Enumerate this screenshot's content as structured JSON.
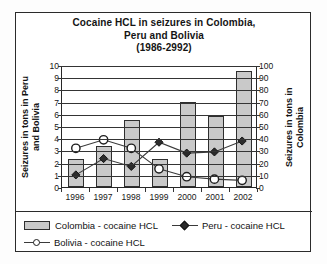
{
  "chart_data": {
    "type": "bar",
    "title": "Cocaine HCL in seizures in Colombia, Peru and Bolivia (1986-2992)",
    "title_lines": [
      "Cocaine HCL in seizures in Colombia,",
      "Peru and Bolivia",
      "(1986-2992)"
    ],
    "categories": [
      "1996",
      "1997",
      "1998",
      "1999",
      "2000",
      "2001",
      "2002"
    ],
    "xlabel": "",
    "ylabel": "Seizures in tons in Peru and Bolivia",
    "ylabel_right": "Seizures in tons in Colombia",
    "ylim": [
      0,
      10
    ],
    "ylim_right": [
      0,
      100
    ],
    "yticks": [
      0,
      1,
      2,
      3,
      4,
      5,
      6,
      7,
      8,
      9,
      10
    ],
    "yticks_right": [
      0,
      10,
      20,
      30,
      40,
      50,
      60,
      70,
      80,
      90,
      100
    ],
    "grid": true,
    "legend_position": "bottom",
    "series": [
      {
        "name": "Colombia - cocaine HCL",
        "kind": "bar",
        "axis": "right",
        "unit": "tons",
        "values": [
          23,
          34,
          55,
          23,
          70,
          58,
          95
        ],
        "color": "#c9c9c9",
        "edge_color": "#2e2e2e",
        "marker": "bar"
      },
      {
        "name": "Peru - cocaine HCL",
        "kind": "line",
        "axis": "left",
        "unit": "tons",
        "values": [
          1.0,
          2.35,
          1.7,
          3.7,
          2.8,
          2.9,
          3.8
        ],
        "color": "#2b2b2b",
        "marker": "filled-diamond"
      },
      {
        "name": "Bolivia - cocaine HCL",
        "kind": "line",
        "axis": "left",
        "unit": "tons",
        "values": [
          3.2,
          3.9,
          3.2,
          1.5,
          0.85,
          0.65,
          0.55
        ],
        "color": "#ffffff",
        "edge_color": "#1d1d1d",
        "marker": "open-circle"
      }
    ]
  }
}
